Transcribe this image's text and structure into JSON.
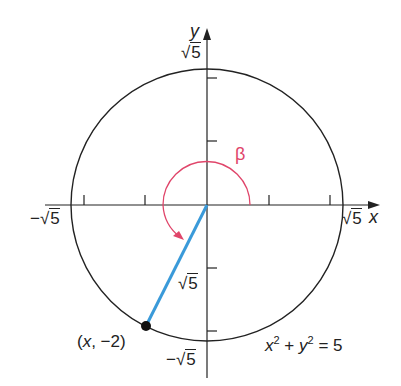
{
  "diagram": {
    "axes": {
      "x_label": "x",
      "y_label": "y",
      "origin_px": [
        207,
        205
      ],
      "tick_count_per_half_axis": 2
    },
    "circle": {
      "equation": {
        "x": "x",
        "exp1": "2",
        "plus": "+",
        "y": "y",
        "exp2": "2",
        "eq": "= 5"
      },
      "radius_label": "5",
      "center_px": [
        207,
        205
      ],
      "radius_px": 136
    },
    "intercept_labels": {
      "top": {
        "sign": "",
        "radicand": "5"
      },
      "bottom": {
        "sign": "−",
        "radicand": "5"
      },
      "left": {
        "sign": "−",
        "radicand": "5"
      },
      "right": {
        "sign": "",
        "radicand": "5"
      }
    },
    "terminal_point": {
      "label": "(x, −2)",
      "label_x": "x",
      "label_open": "(",
      "label_rest": ", −2)"
    },
    "segment_label": {
      "radicand": "5"
    },
    "angle": {
      "symbol": "β"
    },
    "colors": {
      "axis": "#222222",
      "circle": "#222222",
      "segment": "#3a9ad9",
      "angle_arc": "#e0456a",
      "point": "#111111"
    }
  }
}
